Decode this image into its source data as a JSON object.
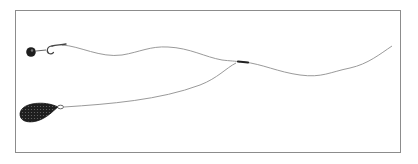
{
  "diagram": {
    "type": "fishing-rig-illustration",
    "components": [
      {
        "id": "bait",
        "label": "",
        "shape": "round-bait-ball"
      },
      {
        "id": "hook",
        "label": "",
        "shape": "hook"
      },
      {
        "id": "hooklength",
        "label": "",
        "shape": "line"
      },
      {
        "id": "swivel",
        "label": "",
        "shape": "swivel"
      },
      {
        "id": "mainline",
        "label": "",
        "shape": "line"
      },
      {
        "id": "sinker-link",
        "label": "",
        "shape": "line"
      },
      {
        "id": "sinker",
        "label": "",
        "shape": "pear-lead-weight"
      }
    ],
    "colors": {
      "line": "#9a9a9a",
      "frame": "#8c8c8c",
      "lead": "#1e1e1e",
      "background": "#ffffff"
    }
  }
}
